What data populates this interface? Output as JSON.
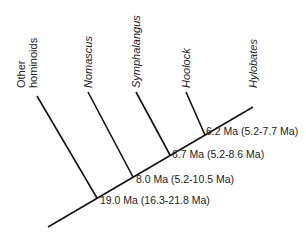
{
  "diagram": {
    "type": "phylogenetic_tree",
    "taxa": [
      {
        "label_line1": "Other",
        "label_line2": "hominoids",
        "italic": false
      },
      {
        "label": "Nomascus",
        "italic": true
      },
      {
        "label": "Symphalangus",
        "italic": true
      },
      {
        "label": "Hoolock",
        "italic": true
      },
      {
        "label": "Hylobates",
        "italic": true
      }
    ],
    "nodes": [
      {
        "age": "19.0 Ma (16.3-21.8 Ma)"
      },
      {
        "age": "8.0 Ma (5.2-10.5 Ma)"
      },
      {
        "age": "6.7 Ma (5.2-8.6 Ma)"
      },
      {
        "age": "6.2 Ma (5.2-7.7 Ma)"
      }
    ],
    "line_color": "#111111",
    "text_color": "#222222"
  }
}
